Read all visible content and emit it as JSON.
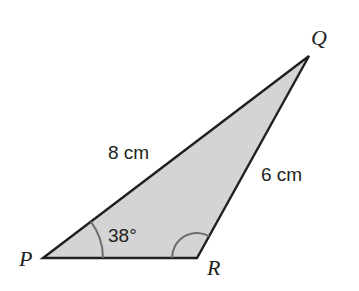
{
  "diagram": {
    "type": "triangle",
    "fill_color": "#d4d4d4",
    "stroke_color": "#231f20",
    "arc_color": "#6d6d6d",
    "vertices": {
      "P": {
        "label": "P",
        "x": 43,
        "y": 258
      },
      "Q": {
        "label": "Q",
        "x": 309,
        "y": 56
      },
      "R": {
        "label": "R",
        "x": 197,
        "y": 258
      }
    },
    "sides": {
      "PQ": {
        "label": "8 cm"
      },
      "QR": {
        "label": "6 cm"
      }
    },
    "angles": {
      "P": {
        "label": "38°"
      },
      "R": {
        "label": ""
      }
    }
  }
}
